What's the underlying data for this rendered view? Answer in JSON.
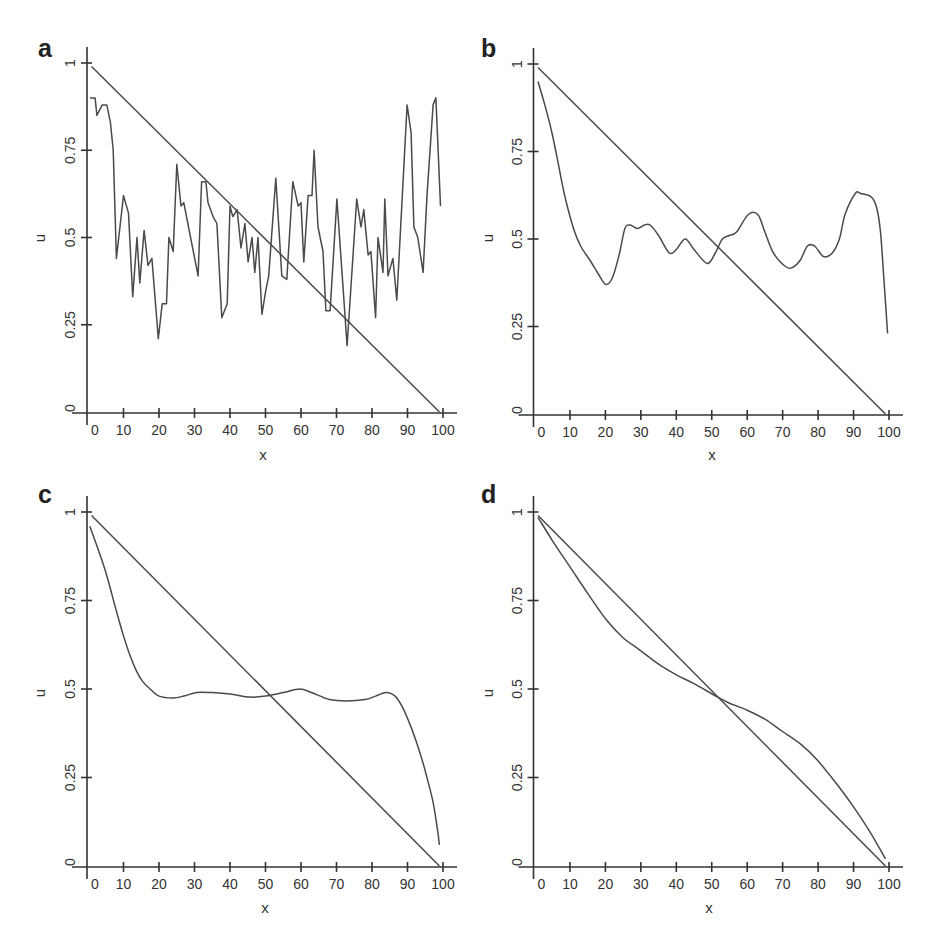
{
  "chart_data": [
    {
      "panel": "a",
      "type": "line",
      "title": "",
      "xlabel": "x",
      "ylabel": "u",
      "xlim": [
        0,
        100
      ],
      "ylim": [
        0,
        1
      ],
      "x_ticks": [
        0,
        10,
        20,
        30,
        40,
        50,
        60,
        70,
        80,
        90,
        100
      ],
      "x_tick_labels": [
        "0",
        "10",
        "20",
        "30",
        "40",
        "50",
        "60",
        "70",
        "80",
        "90",
        "100"
      ],
      "y_ticks": [
        0,
        0.25,
        0.5,
        0.75,
        1
      ],
      "y_tick_labels": [
        "0",
        "0.25",
        "0.5",
        "0.75",
        "1"
      ],
      "grid": false,
      "legend": null,
      "series": [
        {
          "name": "linear",
          "x": [
            1,
            99
          ],
          "y": [
            0.99,
            0.0
          ]
        },
        {
          "name": "solution",
          "x": [
            0.6,
            2,
            2.5,
            4,
            5.3,
            6.3,
            7.1,
            8,
            10,
            11.4,
            12.6,
            13.8,
            14.6,
            15.8,
            16.9,
            18,
            19.8,
            20.9,
            22.1,
            22.8,
            24,
            25,
            26.2,
            27,
            28.7,
            31,
            32,
            33.2,
            33.8,
            35.2,
            36.3,
            37.7,
            39.2,
            40,
            40.8,
            42,
            43.1,
            44.2,
            45.1,
            46.2,
            47,
            47.9,
            49,
            50.1,
            50.9,
            52.9,
            54.6,
            56,
            57.7,
            59.2,
            60,
            60.8,
            62,
            63.1,
            63.7,
            64.8,
            66.2,
            67,
            68.2,
            70.1,
            73,
            75.7,
            76.9,
            77.7,
            78.9,
            79.7,
            81,
            81.7,
            83.1,
            83.6,
            84.5,
            85.9,
            87,
            89.9,
            91,
            91.8,
            92.9,
            94.4,
            95.5,
            97.2,
            98,
            99.3
          ],
          "y": [
            0.9,
            0.9,
            0.85,
            0.88,
            0.88,
            0.83,
            0.75,
            0.44,
            0.62,
            0.57,
            0.33,
            0.5,
            0.37,
            0.52,
            0.42,
            0.44,
            0.21,
            0.31,
            0.31,
            0.5,
            0.46,
            0.71,
            0.59,
            0.6,
            0.51,
            0.39,
            0.66,
            0.66,
            0.6,
            0.56,
            0.54,
            0.27,
            0.31,
            0.59,
            0.56,
            0.58,
            0.47,
            0.54,
            0.43,
            0.5,
            0.4,
            0.5,
            0.28,
            0.35,
            0.39,
            0.67,
            0.39,
            0.38,
            0.66,
            0.59,
            0.6,
            0.43,
            0.62,
            0.62,
            0.75,
            0.53,
            0.46,
            0.29,
            0.29,
            0.61,
            0.19,
            0.61,
            0.53,
            0.58,
            0.45,
            0.46,
            0.27,
            0.5,
            0.4,
            0.61,
            0.39,
            0.44,
            0.32,
            0.88,
            0.8,
            0.53,
            0.5,
            0.4,
            0.62,
            0.88,
            0.9,
            0.59
          ]
        }
      ]
    },
    {
      "panel": "b",
      "type": "line",
      "title": "",
      "xlabel": "x",
      "ylabel": "u",
      "xlim": [
        0,
        100
      ],
      "ylim": [
        0,
        1
      ],
      "x_ticks": [
        0,
        10,
        20,
        30,
        40,
        50,
        60,
        70,
        80,
        90,
        100
      ],
      "x_tick_labels": [
        "0",
        "10",
        "20",
        "30",
        "40",
        "50",
        "60",
        "70",
        "80",
        "90",
        "100"
      ],
      "y_ticks": [
        0,
        0.25,
        0.5,
        0.75,
        1
      ],
      "y_tick_labels": [
        "0",
        "0.25",
        "0.5",
        "0.75",
        "1"
      ],
      "grid": false,
      "legend": null,
      "series": [
        {
          "name": "linear",
          "x": [
            1,
            99
          ],
          "y": [
            0.99,
            0.0
          ]
        },
        {
          "name": "solution",
          "x": [
            1,
            3,
            5,
            7,
            8.6,
            11,
            13,
            15.6,
            18,
            20.1,
            22,
            24,
            25.5,
            27,
            29,
            31,
            32.6,
            35,
            38,
            40,
            42.5,
            45,
            48.7,
            51,
            53,
            55,
            57,
            60.3,
            63,
            65,
            67.4,
            71,
            73,
            75,
            77,
            79,
            81.5,
            84,
            86,
            87.6,
            90.5,
            92,
            95,
            96.5,
            97.6,
            98.6,
            99.6
          ],
          "y": [
            0.95,
            0.88,
            0.8,
            0.7,
            0.62,
            0.53,
            0.48,
            0.44,
            0.4,
            0.37,
            0.39,
            0.46,
            0.53,
            0.54,
            0.53,
            0.54,
            0.54,
            0.51,
            0.46,
            0.47,
            0.5,
            0.47,
            0.43,
            0.46,
            0.5,
            0.51,
            0.52,
            0.57,
            0.57,
            0.52,
            0.46,
            0.42,
            0.42,
            0.44,
            0.48,
            0.48,
            0.45,
            0.46,
            0.5,
            0.57,
            0.63,
            0.63,
            0.62,
            0.59,
            0.52,
            0.38,
            0.23
          ]
        }
      ]
    },
    {
      "panel": "c",
      "type": "line",
      "title": "",
      "xlabel": "x",
      "ylabel": "u",
      "xlim": [
        0,
        100
      ],
      "ylim": [
        0,
        1
      ],
      "x_ticks": [
        0,
        10,
        20,
        30,
        40,
        50,
        60,
        70,
        80,
        90,
        100
      ],
      "x_tick_labels": [
        "0",
        "10",
        "20",
        "30",
        "40",
        "50",
        "60",
        "70",
        "80",
        "90",
        "100"
      ],
      "y_ticks": [
        0,
        0.25,
        0.5,
        0.75,
        1
      ],
      "y_tick_labels": [
        "0",
        "0.25",
        "0.5",
        "0.75",
        "1"
      ],
      "grid": false,
      "legend": null,
      "series": [
        {
          "name": "linear",
          "x": [
            1,
            99
          ],
          "y": [
            0.99,
            0.0
          ]
        },
        {
          "name": "solution",
          "x": [
            0.5,
            3,
            5.3,
            8,
            10,
            12,
            13.7,
            15.5,
            17.5,
            20,
            24,
            27,
            30.6,
            35,
            40,
            45.6,
            50,
            55,
            59.7,
            63,
            68,
            73,
            78,
            81,
            84,
            86.5,
            88.5,
            90.7,
            92.5,
            94.4,
            96,
            97.2,
            98.2,
            99
          ],
          "y": [
            0.96,
            0.89,
            0.82,
            0.72,
            0.65,
            0.59,
            0.55,
            0.52,
            0.5,
            0.48,
            0.475,
            0.48,
            0.49,
            0.49,
            0.486,
            0.477,
            0.48,
            0.49,
            0.5,
            0.49,
            0.47,
            0.466,
            0.47,
            0.48,
            0.49,
            0.48,
            0.45,
            0.4,
            0.35,
            0.29,
            0.23,
            0.18,
            0.12,
            0.06
          ]
        }
      ]
    },
    {
      "panel": "d",
      "type": "line",
      "title": "",
      "xlabel": "x",
      "ylabel": "u",
      "xlim": [
        0,
        100
      ],
      "ylim": [
        0,
        1
      ],
      "x_ticks": [
        0,
        10,
        20,
        30,
        40,
        50,
        60,
        70,
        80,
        90,
        100
      ],
      "x_tick_labels": [
        "0",
        "10",
        "20",
        "30",
        "40",
        "50",
        "60",
        "70",
        "80",
        "90",
        "100"
      ],
      "y_ticks": [
        0,
        0.25,
        0.5,
        0.75,
        1
      ],
      "y_tick_labels": [
        "0",
        "0.25",
        "0.5",
        "0.75",
        "1"
      ],
      "grid": false,
      "legend": null,
      "series": [
        {
          "name": "linear",
          "x": [
            1,
            99
          ],
          "y": [
            0.99,
            0.0
          ]
        },
        {
          "name": "solution",
          "x": [
            1,
            5,
            10,
            15,
            20.3,
            25,
            29.7,
            35,
            40,
            45,
            51.7,
            55,
            60,
            65,
            70,
            75,
            79.7,
            85,
            90,
            95,
            99
          ],
          "y": [
            0.985,
            0.92,
            0.845,
            0.77,
            0.695,
            0.645,
            0.61,
            0.57,
            0.54,
            0.515,
            0.477,
            0.46,
            0.44,
            0.415,
            0.38,
            0.345,
            0.3,
            0.235,
            0.167,
            0.09,
            0.02
          ]
        }
      ]
    }
  ],
  "panels": {
    "a": {
      "label": "a",
      "xlabel": "x",
      "ylabel": "u"
    },
    "b": {
      "label": "b",
      "xlabel": "x",
      "ylabel": "u"
    },
    "c": {
      "label": "c",
      "xlabel": "x",
      "ylabel": "u"
    },
    "d": {
      "label": "d",
      "xlabel": "x",
      "ylabel": "u"
    }
  }
}
